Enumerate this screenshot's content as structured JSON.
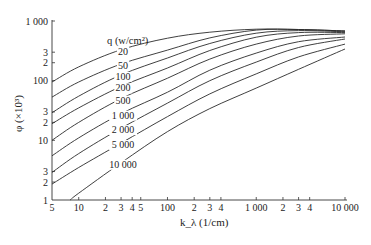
{
  "chart_data": {
    "type": "line",
    "title": "",
    "xlabel": "k_λ (1/cm)",
    "ylabel": "φ (×10³)",
    "xscale": "log",
    "yscale": "log",
    "xlim": [
      5,
      10000
    ],
    "ylim": [
      1,
      1000
    ],
    "grid": false,
    "legend_title": "q (w/cm²)",
    "legend_position": "inline labels near left end of each curve",
    "x_ticks": [
      {
        "v": 5,
        "label": "5"
      },
      {
        "v": 10,
        "label": "10"
      },
      {
        "v": 20,
        "label": "2"
      },
      {
        "v": 30,
        "label": "3"
      },
      {
        "v": 40,
        "label": "4"
      },
      {
        "v": 50,
        "label": "5"
      },
      {
        "v": 100,
        "label": "100"
      },
      {
        "v": 200,
        "label": "2"
      },
      {
        "v": 300,
        "label": "3"
      },
      {
        "v": 400,
        "label": "4"
      },
      {
        "v": 1000,
        "label": "1 000"
      },
      {
        "v": 2000,
        "label": "2"
      },
      {
        "v": 3000,
        "label": "3"
      },
      {
        "v": 4000,
        "label": "4"
      },
      {
        "v": 10000,
        "label": "10 000"
      }
    ],
    "y_ticks": [
      {
        "v": 1,
        "label": "1"
      },
      {
        "v": 2,
        "label": "2"
      },
      {
        "v": 3,
        "label": "3"
      },
      {
        "v": 10,
        "label": "10"
      },
      {
        "v": 20,
        "label": "2"
      },
      {
        "v": 30,
        "label": "3"
      },
      {
        "v": 100,
        "label": "100"
      },
      {
        "v": 200,
        "label": "2"
      },
      {
        "v": 300,
        "label": "3"
      },
      {
        "v": 1000,
        "label": "1 000"
      }
    ],
    "x": [
      5,
      10,
      30,
      100,
      300,
      1000,
      3000,
      10000
    ],
    "series": [
      {
        "name": "20",
        "label": "20",
        "x": [
          5,
          10,
          30,
          100,
          300,
          1000,
          3000,
          10000
        ],
        "values": [
          95,
          170,
          330,
          515,
          650,
          730,
          720,
          680
        ]
      },
      {
        "name": "50",
        "label": "50",
        "x": [
          5,
          10,
          30,
          100,
          300,
          1000,
          3000,
          10000
        ],
        "values": [
          53,
          95,
          190,
          325,
          520,
          705,
          720,
          680
        ]
      },
      {
        "name": "100",
        "label": "100",
        "x": [
          5,
          10,
          30,
          100,
          300,
          1000,
          3000,
          10000
        ],
        "values": [
          29,
          55,
          125,
          240,
          420,
          625,
          690,
          660
        ]
      },
      {
        "name": "200",
        "label": "200",
        "x": [
          5,
          10,
          30,
          100,
          300,
          1000,
          3000,
          10000
        ],
        "values": [
          19,
          35,
          80,
          163,
          320,
          535,
          640,
          640
        ]
      },
      {
        "name": "500",
        "label": "500",
        "x": [
          5,
          10,
          30,
          100,
          300,
          1000,
          3000,
          10000
        ],
        "values": [
          10,
          20,
          50,
          110,
          230,
          410,
          560,
          610
        ]
      },
      {
        "name": "1 000",
        "label": "1 000",
        "x": [
          5,
          10,
          30,
          100,
          300,
          1000,
          3000,
          10000
        ],
        "values": [
          5.5,
          11,
          28,
          64,
          150,
          290,
          450,
          540
        ]
      },
      {
        "name": "2 000",
        "label": "2 000",
        "x": [
          5,
          10,
          30,
          100,
          300,
          1000,
          3000,
          10000
        ],
        "values": [
          2.9,
          6,
          16,
          42,
          100,
          205,
          360,
          500
        ]
      },
      {
        "name": "5 000",
        "label": "5 000",
        "x": [
          5,
          10,
          30,
          100,
          300,
          1000,
          3000,
          10000
        ],
        "values": [
          1.85,
          3.5,
          9,
          25,
          60,
          130,
          250,
          410
        ]
      },
      {
        "name": "10 000",
        "label": "10 000",
        "x": [
          8,
          10,
          30,
          100,
          300,
          1000,
          3000,
          10000
        ],
        "values": [
          1,
          1.3,
          4.2,
          14,
          34,
          75,
          155,
          340
        ]
      }
    ]
  },
  "layout": {
    "line_color": "#2a2a2a",
    "axis_color": "#333333",
    "px_x0": 52,
    "px_x1": 345,
    "px_y0": 200,
    "px_y1": 21
  }
}
